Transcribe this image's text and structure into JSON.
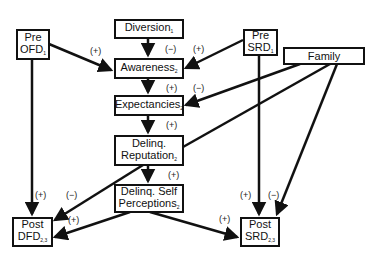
{
  "diagram": {
    "nodes": {
      "diversion": {
        "label": "Diversion",
        "sub": "1"
      },
      "pre_ofd": {
        "line1": "Pre",
        "line2": "OFD",
        "sub": "1"
      },
      "awareness": {
        "label": "Awareness",
        "sub": "2"
      },
      "pre_srd": {
        "line1": "Pre",
        "line2": "SRD",
        "sub": "1"
      },
      "family": {
        "label": "Family"
      },
      "expectancies": {
        "label": "Expectancies",
        "sub": "2"
      },
      "delinq_reputation": {
        "line1": "Delinq.",
        "line2": "Reputation",
        "sub": "2"
      },
      "delinq_self": {
        "line1": "Delinq. Self",
        "line2": "Perceptions",
        "sub": "2"
      },
      "post_dfd": {
        "line1": "Post",
        "line2": "DFD",
        "sub": "2,3"
      },
      "post_srd": {
        "line1": "Post",
        "line2": "SRD",
        "sub": "2,3"
      }
    },
    "edge_labels": {
      "ofd_to_awareness": "(+)",
      "diversion_to_awareness": "(−)",
      "srd_to_awareness": "(+)",
      "awareness_to_expectancies": "(+)",
      "family_to_expectancies": "(−)",
      "expectancies_to_reputation": "(+)",
      "reputation_to_self": "(+)",
      "ofd_to_postdfd": "(+)",
      "reputation_to_postdfd": "(−)",
      "self_to_postdfd": "(+)",
      "self_to_postsrd": "(+)",
      "presrd_to_postsrd": "(+)",
      "family_to_postsrd": "(−)"
    }
  }
}
